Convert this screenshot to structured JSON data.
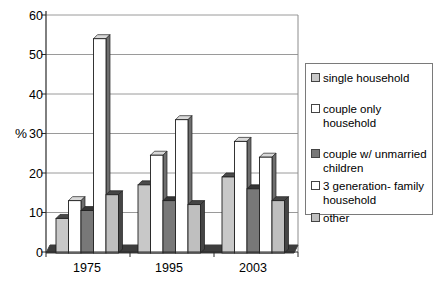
{
  "chart_data": {
    "type": "bar",
    "title": "",
    "categories": [
      "1975",
      "1995",
      "2003"
    ],
    "series": [
      {
        "name": "single household",
        "values": [
          8.5,
          17,
          19
        ],
        "fill": "#c8c8c8",
        "top": "#4a4a4a",
        "side": "#4a4a4a"
      },
      {
        "name": "couple only household",
        "values": [
          13,
          24.5,
          28
        ],
        "fill": "#ffffff",
        "top": "#d9d9d9",
        "side": "#6e6e6e"
      },
      {
        "name": "couple w/ unmarried children",
        "values": [
          10.5,
          13,
          16
        ],
        "fill": "#787878",
        "top": "#353535",
        "side": "#353535"
      },
      {
        "name": "3 generation- family household",
        "values": [
          54,
          33.5,
          24
        ],
        "fill": "#ffffff",
        "top": "#d9d9d9",
        "side": "#6e6e6e"
      },
      {
        "name": "other",
        "values": [
          14.5,
          12,
          13
        ],
        "fill": "#bfbfbf",
        "top": "#454545",
        "side": "#454545"
      }
    ],
    "xlabel": "",
    "ylabel": "%",
    "ylim": [
      0,
      60
    ],
    "ytick_step": 10,
    "yticks": [
      "60",
      "50",
      "40",
      "30",
      "20",
      "10",
      "0"
    ],
    "grid": true,
    "legend_position": "right",
    "style": "3d-oblique-bars"
  },
  "colors": {
    "gridline": "#9a9a9a",
    "axis": "#2b2b2b",
    "plot_border": "#8c8c8c",
    "floor": "#3d3d3d",
    "bar_outline": "#1f1f1f",
    "legend_border": "#7a7a7a",
    "text": "#000000",
    "background": "#ffffff"
  }
}
